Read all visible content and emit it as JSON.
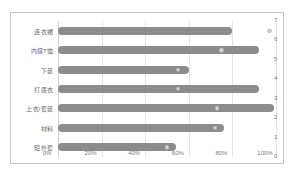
{
  "chart_data": {
    "type": "bar",
    "orientation": "horizontal",
    "title": "",
    "xlabel": "",
    "ylabel": "",
    "categories": [
      "连衣裙",
      "内搭T恤",
      "下装",
      "打底衣",
      "上衣/套装",
      "材料",
      "短外套"
    ],
    "series": [
      {
        "name": "占比",
        "type": "bar",
        "values": [
          80,
          92,
          60,
          92,
          99,
          76,
          54
        ]
      },
      {
        "name": "标记点",
        "type": "scatter",
        "values": [
          97,
          75,
          55,
          55,
          73,
          72,
          50
        ]
      }
    ],
    "xlim": [
      0,
      100
    ],
    "xticks": [
      0,
      20,
      40,
      60,
      80,
      100
    ],
    "xticklabels": [
      "0%",
      "20%",
      "40%",
      "60%",
      "80%",
      "100%"
    ],
    "secondary_yaxis": {
      "position": "right",
      "ylim": [
        0,
        7
      ],
      "yticks": [
        7,
        6,
        5,
        4,
        3,
        2,
        1,
        0
      ],
      "yticklabels": [
        "7",
        "6",
        "5",
        "4",
        "3",
        "2",
        "1",
        "0"
      ]
    },
    "grid": "vertical",
    "legend": "none",
    "colors": {
      "bar": "#8c8c8c",
      "dot": "#d8d8d8",
      "grid": "#e4e4e4",
      "frame": "#c8c8c8",
      "text": "#7a7a7a"
    }
  }
}
